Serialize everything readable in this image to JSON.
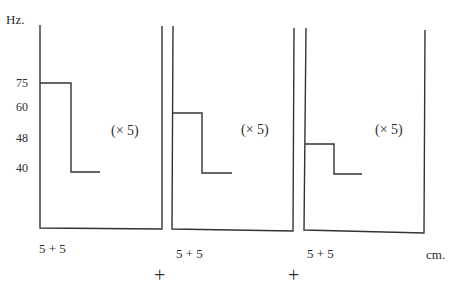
{
  "diagram": {
    "y_unit_label": "Hz.",
    "x_unit_label": "cm.",
    "y_tick_labels": [
      "75",
      "60",
      "48",
      "40"
    ],
    "panels": [
      {
        "name": "panel-1",
        "high_value_hz": 75,
        "low_value_hz": 40,
        "multiplier_label": "(× 5)",
        "width_label": "5 + 5"
      },
      {
        "name": "panel-2",
        "high_value_hz": 60,
        "low_value_hz": 40,
        "multiplier_label": "(× 5)",
        "width_label": "5 + 5"
      },
      {
        "name": "panel-3",
        "high_value_hz": 48,
        "low_value_hz": 40,
        "multiplier_label": "(× 5)",
        "width_label": "5 + 5"
      }
    ],
    "joiner_symbol": "+"
  }
}
